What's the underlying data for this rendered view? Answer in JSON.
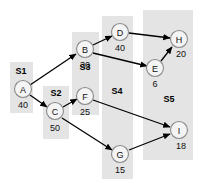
{
  "diagram": {
    "type": "directed-acyclic-graph",
    "title": "",
    "canvas": {
      "width": 201,
      "height": 187
    },
    "colors": {
      "band": "#e4e4e4",
      "node_fill": "#f4f4f4",
      "node_stroke": "#8a8a8a",
      "edge": "#000000",
      "text": "#111111",
      "background": "#ffffff"
    },
    "stages": [
      {
        "id": "S1",
        "label": "S1",
        "x": 10,
        "y": 62,
        "width": 23,
        "height": 51,
        "label_x": 21,
        "label_y": 74
      },
      {
        "id": "S2",
        "label": "S2",
        "x": 43,
        "y": 86,
        "width": 26,
        "height": 53,
        "label_x": 56,
        "label_y": 96
      },
      {
        "id": "S3",
        "label": "S3",
        "x": 72,
        "y": 32,
        "width": 27,
        "height": 83,
        "label_x": 85,
        "label_y": 70
      },
      {
        "id": "S4",
        "label": "S4",
        "x": 102,
        "y": 16,
        "width": 31,
        "height": 163,
        "label_x": 117,
        "label_y": 94
      },
      {
        "id": "S5",
        "label": "S5",
        "x": 143,
        "y": 10,
        "width": 50,
        "height": 150,
        "label_x": 169,
        "label_y": 102
      }
    ],
    "nodes": [
      {
        "id": "A",
        "label": "A",
        "weight": "40",
        "cx": 23,
        "cy": 89,
        "r": 8.5,
        "weight_x": 23,
        "weight_y": 108
      },
      {
        "id": "C",
        "label": "C",
        "weight": "50",
        "cx": 55,
        "cy": 111,
        "r": 8.5,
        "weight_x": 55,
        "weight_y": 131
      },
      {
        "id": "B",
        "label": "B",
        "weight": "30",
        "cx": 85,
        "cy": 49,
        "r": 8.5,
        "weight_x": 85,
        "weight_y": 68
      },
      {
        "id": "F",
        "label": "F",
        "weight": "25",
        "cx": 85,
        "cy": 96,
        "r": 8.5,
        "weight_x": 85,
        "weight_y": 115
      },
      {
        "id": "D",
        "label": "D",
        "weight": "40",
        "cx": 120,
        "cy": 32,
        "r": 8.5,
        "weight_x": 120,
        "weight_y": 51
      },
      {
        "id": "G",
        "label": "G",
        "weight": "15",
        "cx": 120,
        "cy": 154,
        "r": 8.5,
        "weight_x": 120,
        "weight_y": 173
      },
      {
        "id": "H",
        "label": "H",
        "weight": "20",
        "cx": 179,
        "cy": 39,
        "r": 8.5,
        "weight_x": 181,
        "weight_y": 57
      },
      {
        "id": "E",
        "label": "E",
        "weight": "6",
        "cx": 155,
        "cy": 68,
        "r": 8.5,
        "weight_x": 155,
        "weight_y": 87
      },
      {
        "id": "I",
        "label": "I",
        "weight": "18",
        "cx": 179,
        "cy": 130,
        "r": 8.5,
        "weight_x": 181,
        "weight_y": 149
      }
    ],
    "edges": [
      {
        "from": "A",
        "to": "B",
        "x1": 30,
        "y1": 85,
        "x2": 76,
        "y2": 54
      },
      {
        "from": "A",
        "to": "C",
        "x1": 30,
        "y1": 95,
        "x2": 47,
        "y2": 107
      },
      {
        "from": "C",
        "to": "F",
        "x1": 63,
        "y1": 107,
        "x2": 77,
        "y2": 99
      },
      {
        "from": "C",
        "to": "G",
        "x1": 62,
        "y1": 118,
        "x2": 112,
        "y2": 150
      },
      {
        "from": "B",
        "to": "D",
        "x1": 93,
        "y1": 45,
        "x2": 112,
        "y2": 36
      },
      {
        "from": "B",
        "to": "E",
        "x1": 93,
        "y1": 53,
        "x2": 147,
        "y2": 66
      },
      {
        "from": "D",
        "to": "H",
        "x1": 129,
        "y1": 33,
        "x2": 170,
        "y2": 38
      },
      {
        "from": "E",
        "to": "H",
        "x1": 161,
        "y1": 61,
        "x2": 172,
        "y2": 47
      },
      {
        "from": "F",
        "to": "I",
        "x1": 93,
        "y1": 100,
        "x2": 170,
        "y2": 127
      },
      {
        "from": "G",
        "to": "I",
        "x1": 129,
        "y1": 150,
        "x2": 170,
        "y2": 134
      }
    ]
  }
}
